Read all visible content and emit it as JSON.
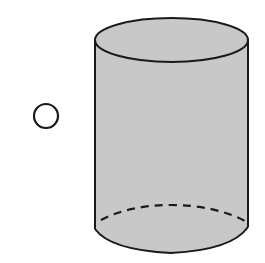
{
  "figure": {
    "shape": "cylinder",
    "colors": {
      "fill": "#c8c8c8",
      "stroke": "#1a1a1a",
      "background": "#ffffff"
    },
    "hidden_edge_style": "dashed"
  },
  "choice": {
    "selected": false
  }
}
